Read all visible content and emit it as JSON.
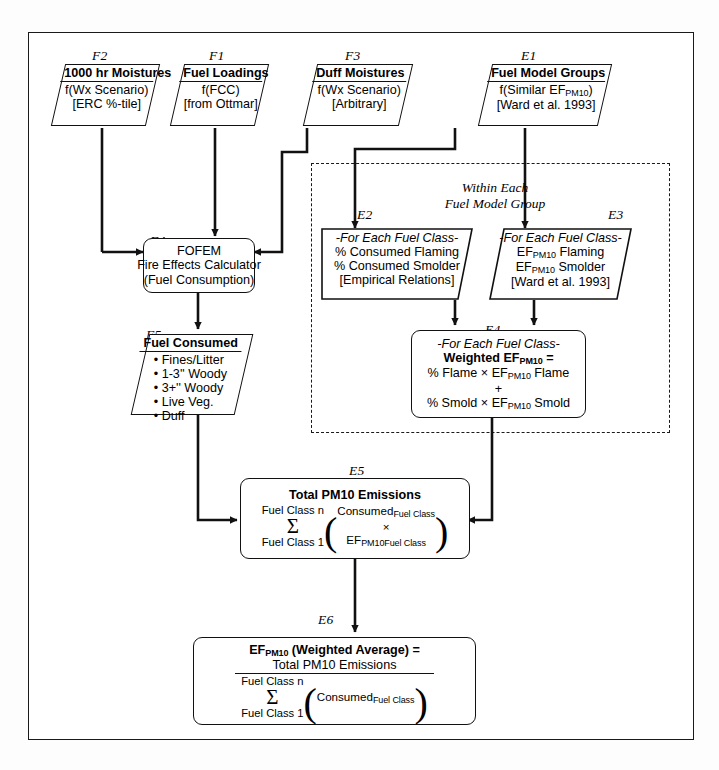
{
  "diagram": {
    "within_caption_line1": "Within Each",
    "within_caption_line2": "Fuel Model Group",
    "tags": {
      "F1": "F1",
      "F2": "F2",
      "F3": "F3",
      "F4": "F4",
      "F5": "F5",
      "E1": "E1",
      "E2": "E2",
      "E3": "E3",
      "E4": "E4",
      "E5": "E5",
      "E6": "E6"
    },
    "nodes": {
      "F2": {
        "tag": "F2",
        "header": "1000 hr Moistures",
        "lines": [
          "f(Wx Scenario)",
          "[ERC %-tile]"
        ],
        "shape": "parallelogram"
      },
      "F1": {
        "tag": "F1",
        "header": "Fuel Loadings",
        "lines": [
          "f(FCC)",
          "[from Ottmar]"
        ],
        "shape": "parallelogram"
      },
      "F3": {
        "tag": "F3",
        "header": "Duff Moistures",
        "lines": [
          "f(Wx Scenario)",
          "[Arbitrary]"
        ],
        "shape": "parallelogram"
      },
      "E1": {
        "tag": "E1",
        "header": "Fuel Model Groups",
        "lines": [
          "f(Similar EF_PM10)",
          "[Ward et al. 1993]"
        ],
        "line1_pre": "f(Similar EF",
        "line1_sub": "PM10",
        "line1_post": ")",
        "shape": "parallelogram"
      },
      "F4": {
        "tag": "F4",
        "lines": [
          "FOFEM",
          "Fire Effects Calculator",
          "(Fuel Consumption)"
        ],
        "shape": "rounded-process"
      },
      "F5": {
        "tag": "F5",
        "header": "Fuel Consumed",
        "bullets": [
          "Fines/Litter",
          "1-3'' Woody",
          "3+'' Woody",
          "Live Veg.",
          "Duff"
        ],
        "shape": "parallelogram"
      },
      "E2": {
        "tag": "E2",
        "line1": "-For Each Fuel Class-",
        "line2": "% Consumed Flaming",
        "line3": "% Consumed Smolder",
        "line4": "[Empirical Relations]",
        "shape": "trapezoid-left"
      },
      "E3": {
        "tag": "E3",
        "line1": "-For Each Fuel Class-",
        "line2_pre": "EF",
        "line2_sub": "PM10",
        "line2_post": " Flaming",
        "line3_pre": "EF",
        "line3_sub": "PM10",
        "line3_post": " Smolder",
        "line4": "[Ward et al. 1993]",
        "shape": "trapezoid-right"
      },
      "E4": {
        "tag": "E4",
        "line1": "-For Each Fuel Class-",
        "line2_pre": "Weighted EF",
        "line2_sub": "PM10",
        "line2_post": " =",
        "line3_pre": "% Flame × EF",
        "line3_sub": "PM10",
        "line3_post": " Flame",
        "line4": "+",
        "line5_pre": "% Smold × EF",
        "line5_sub": "PM10",
        "line5_post": " Smold",
        "shape": "rounded-process"
      },
      "E5": {
        "tag": "E5",
        "header": "Total PM10 Emissions",
        "sum_top": "Fuel Class n",
        "sum_sigma": "Σ",
        "sum_bottom": "Fuel Class 1",
        "term1_pre": "Consumed",
        "term1_sub": "Fuel Class",
        "term_op": "×",
        "term2_pre": "EF",
        "term2_sub": "PM10Fuel Class",
        "shape": "rounded-process"
      },
      "E6": {
        "tag": "E6",
        "header_pre": "EF",
        "header_sub": "PM10",
        "header_post": " (Weighted Average) =",
        "numerator": "Total PM10 Emissions",
        "sum_top": "Fuel Class n",
        "sum_sigma": "Σ",
        "sum_bottom": "Fuel Class 1",
        "den_term_pre": "Consumed",
        "den_term_sub": "Fuel Class",
        "shape": "rounded-process"
      }
    },
    "colors": {
      "line": "#111111",
      "background": "#ffffff",
      "frame": "#1a1a1a"
    }
  }
}
